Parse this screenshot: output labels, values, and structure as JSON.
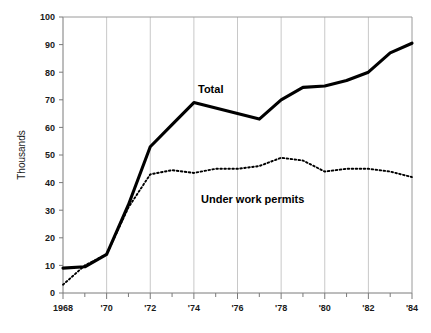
{
  "chart_data": {
    "type": "line",
    "title": "",
    "subtitle": "",
    "xlabel": "",
    "ylabel": "Thousands",
    "xlim": [
      1968,
      1984
    ],
    "ylim": [
      0,
      100
    ],
    "grid": "vertical-gridlines-at-even-years",
    "legend": "inline-labels-on-plot",
    "x": [
      1968,
      1969,
      1970,
      1971,
      1972,
      1973,
      1974,
      1975,
      1976,
      1977,
      1978,
      1979,
      1980,
      1981,
      1982,
      1983,
      1984
    ],
    "x_tick_labels": [
      "1968",
      "",
      "'70",
      "",
      "'72",
      "",
      "'74",
      "",
      "'76",
      "",
      "'78",
      "",
      "'80",
      "",
      "'82",
      "",
      "'84"
    ],
    "y_ticks": [
      0,
      10,
      20,
      30,
      40,
      50,
      60,
      70,
      80,
      90,
      100
    ],
    "y_tick_labels": [
      "0",
      "10",
      "20",
      "30",
      "40",
      "50",
      "60",
      "70",
      "80",
      "90",
      "100"
    ],
    "series": [
      {
        "name": "Total",
        "style": "solid-thick",
        "color": "#000000",
        "values": [
          9,
          9.5,
          14,
          32,
          53,
          61,
          69,
          67,
          65,
          63,
          70,
          74.5,
          75,
          77,
          80,
          87,
          90.5
        ],
        "label_text": "Total"
      },
      {
        "name": "Under work permits",
        "style": "dotted",
        "color": "#000000",
        "values": [
          3,
          10,
          14,
          31,
          43,
          44.5,
          43.5,
          45,
          45,
          46,
          49,
          48,
          44,
          45,
          45,
          44,
          42
        ],
        "label_text": "Under work permits"
      }
    ],
    "annotations": [
      {
        "text": "Total",
        "x": 1976,
        "y": 81
      },
      {
        "text": "Under work permits",
        "x": 1979.2,
        "y": 35
      }
    ]
  },
  "axes": {
    "y_title": "Thousands",
    "y_labels": [
      "100",
      "90",
      "80",
      "70",
      "60",
      "50",
      "40",
      "30",
      "20",
      "10",
      "0"
    ],
    "x_labels": [
      "1968",
      "'70",
      "'72",
      "'74",
      "'76",
      "'78",
      "'80",
      "'82",
      "'84"
    ]
  },
  "labels": {
    "total": "Total",
    "under_work_permits": "Under work permits"
  },
  "colors": {
    "line": "#000000",
    "axis": "#7a7a7a",
    "gridline": "#c8c8c8",
    "background": "#ffffff",
    "text": "#1a1a1a"
  }
}
